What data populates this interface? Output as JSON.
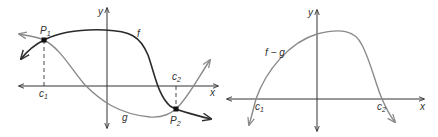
{
  "colors": {
    "f": "#2b2b2b",
    "g": "#8a8a8a",
    "axis": "#333333",
    "f_minus_g": "#8a8a8a"
  },
  "left_graph": {
    "x_axis_label": "x",
    "y_axis_label": "y",
    "curve_f_label": "f",
    "curve_g_label": "g",
    "point_1": {
      "label": "P",
      "sub": "1"
    },
    "point_2": {
      "label": "P",
      "sub": "2"
    },
    "c1": {
      "label": "c",
      "sub": "1"
    },
    "c2": {
      "label": "c",
      "sub": "2"
    }
  },
  "right_graph": {
    "x_axis_label": "x",
    "y_axis_label": "y",
    "curve_label": "f − g",
    "c1": {
      "label": "c",
      "sub": "1"
    },
    "c2": {
      "label": "c",
      "sub": "2"
    }
  }
}
